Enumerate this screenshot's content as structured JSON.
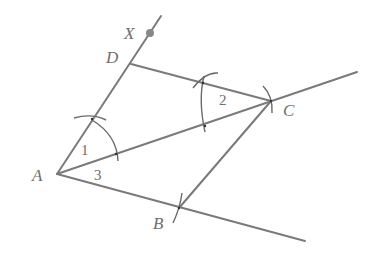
{
  "diagram": {
    "points": {
      "A": {
        "label": "A",
        "x": 57,
        "y": 174
      },
      "B": {
        "label": "B",
        "x": 179,
        "y": 208
      },
      "C": {
        "label": "C",
        "x": 271,
        "y": 101
      },
      "D": {
        "label": "D",
        "x": 131,
        "y": 64
      },
      "X": {
        "label": "X",
        "x": 150,
        "y": 33
      }
    },
    "angles": {
      "angle1": {
        "label": "1"
      },
      "angle2": {
        "label": "2"
      },
      "angle3": {
        "label": "3"
      }
    },
    "colors": {
      "line": "#7a7a7a",
      "label": "#6e6e6e",
      "point_x": "#888888"
    }
  }
}
